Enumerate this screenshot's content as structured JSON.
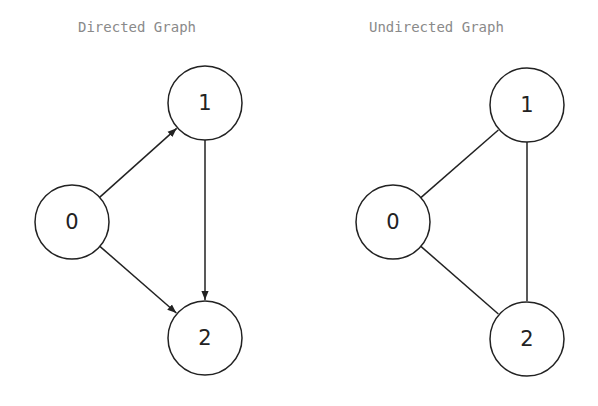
{
  "graphs": [
    {
      "title": "Directed Graph",
      "directed": true,
      "nodes": [
        {
          "id": "0",
          "label": "0",
          "cx": 72,
          "cy": 222
        },
        {
          "id": "1",
          "label": "1",
          "cx": 205,
          "cy": 103
        },
        {
          "id": "2",
          "label": "2",
          "cx": 205,
          "cy": 338
        }
      ],
      "edges": [
        {
          "from": "0",
          "to": "1"
        },
        {
          "from": "0",
          "to": "2"
        },
        {
          "from": "1",
          "to": "2"
        }
      ]
    },
    {
      "title": "Undirected Graph",
      "directed": false,
      "nodes": [
        {
          "id": "0",
          "label": "0",
          "cx": 393,
          "cy": 222
        },
        {
          "id": "1",
          "label": "1",
          "cx": 527,
          "cy": 105
        },
        {
          "id": "2",
          "label": "2",
          "cx": 527,
          "cy": 339
        }
      ],
      "edges": [
        {
          "from": "0",
          "to": "1"
        },
        {
          "from": "0",
          "to": "2"
        },
        {
          "from": "1",
          "to": "2"
        }
      ]
    }
  ],
  "style": {
    "node_radius": 37,
    "stroke": "#222222",
    "title_color": "#8a8a8a"
  }
}
